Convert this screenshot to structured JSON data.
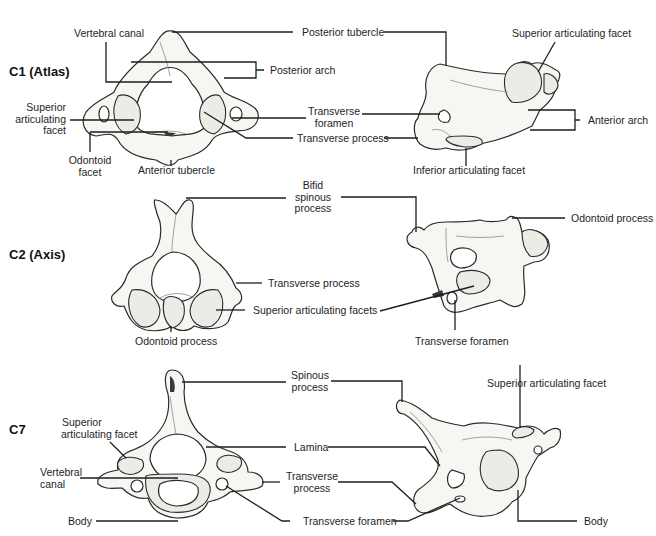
{
  "figure": {
    "type": "anatomical-diagram"
  },
  "rows": [
    {
      "title": "C1 (Atlas)",
      "superior_view_labels": {
        "vertebral_canal": "Vertebral canal",
        "posterior_tubercle": "Posterior tubercle",
        "posterior_arch": "Posterior arch",
        "superior_articulating_facet": [
          "Superior",
          "articulating",
          "facet"
        ],
        "transverse_foramen": [
          "Transverse",
          "foramen"
        ],
        "transverse_process": "Transverse process",
        "odontoid_facet": [
          "Odontoid",
          "facet"
        ],
        "anterior_tubercle": "Anterior tubercle"
      },
      "lateral_view_labels": {
        "superior_articulating_facet": "Superior articulating facet",
        "anterior_arch": "Anterior arch",
        "inferior_articulating_facet": "Inferior articulating facet"
      }
    },
    {
      "title": "C2 (Axis)",
      "superior_view_labels": {
        "bifid_spinous_process": [
          "Bifid",
          "spinous",
          "process"
        ],
        "transverse_process": "Transverse process",
        "superior_articulating_facets": "Superior articulating facets",
        "odontoid_process_bottom": "Odontoid process"
      },
      "lateral_view_labels": {
        "odontoid_process": "Odontoid process",
        "transverse_foramen": "Transverse foramen"
      }
    },
    {
      "title": "C7",
      "superior_view_labels": {
        "superior_articulating_facet": [
          "Superior",
          "articulating facet"
        ],
        "vertebral_canal": [
          "Vertebral",
          "canal"
        ],
        "body": "Body",
        "spinous_process": [
          "Spinous",
          "process"
        ],
        "lamina": "Lamina",
        "transverse_process": [
          "Transverse",
          "process"
        ],
        "transverse_foramen": "Transverse foramen"
      },
      "lateral_view_labels": {
        "superior_articulating_facet": "Superior articulating facet",
        "body": "Body"
      }
    }
  ]
}
